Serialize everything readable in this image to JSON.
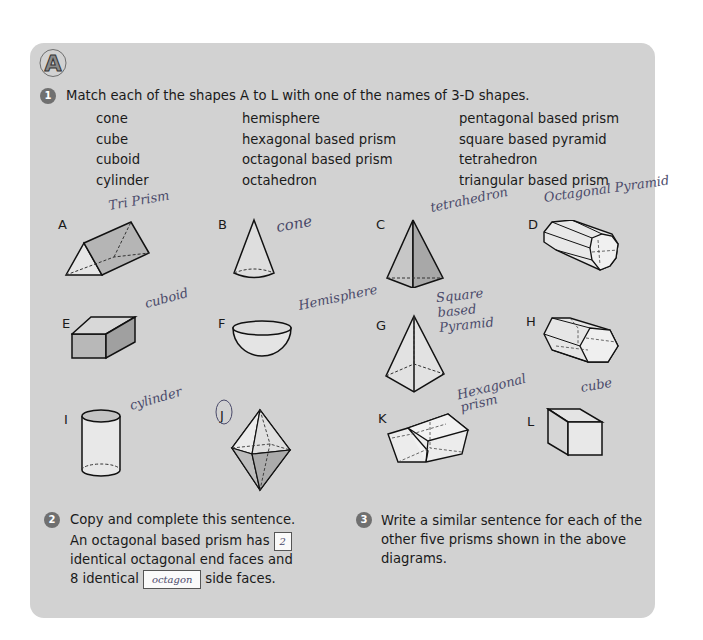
{
  "section": {
    "letter": "A"
  },
  "question1": {
    "number": "1",
    "prompt": "Match each of the shapes A to L with one of the names of 3-D shapes.",
    "names_columns": [
      [
        "cone",
        "cube",
        "cuboid",
        "cylinder"
      ],
      [
        "hemisphere",
        "hexagonal based prism",
        "octagonal based prism",
        "octahedron"
      ],
      [
        "pentagonal based prism",
        "square based pyramid",
        "tetrahedron",
        "triangular based prism"
      ]
    ],
    "shapes": [
      {
        "label": "A",
        "handwritten_answer": "Tri Prism"
      },
      {
        "label": "B",
        "handwritten_answer": "cone"
      },
      {
        "label": "C",
        "handwritten_answer": "tetrahedron"
      },
      {
        "label": "D",
        "handwritten_answer": "Octagonal Pyramid"
      },
      {
        "label": "E",
        "handwritten_answer": "cuboid"
      },
      {
        "label": "F",
        "handwritten_answer": "Hemisphere"
      },
      {
        "label": "G",
        "handwritten_answer": "Square based Pyramid"
      },
      {
        "label": "H",
        "handwritten_answer": ""
      },
      {
        "label": "I",
        "handwritten_answer": "cylinder"
      },
      {
        "label": "J",
        "handwritten_answer": ""
      },
      {
        "label": "K",
        "handwritten_answer": "Hexagonal prism"
      },
      {
        "label": "L",
        "handwritten_answer": "cube"
      }
    ]
  },
  "question2": {
    "number": "2",
    "prompt": "Copy and complete this sentence.",
    "line1": "An octagonal based prism has",
    "blank1_answer": "2",
    "line2": "identical octagonal end faces and",
    "line3_start": "8 identical",
    "blank2_answer": "octagon",
    "line3_end": "side faces."
  },
  "question3": {
    "number": "3",
    "lines": [
      "Write a similar sentence for each of the",
      "other five prisms shown in the above",
      "diagrams."
    ]
  },
  "colors": {
    "panel": "#d2d2d2",
    "badge": "#707070",
    "ink": "#4a4a6a"
  }
}
